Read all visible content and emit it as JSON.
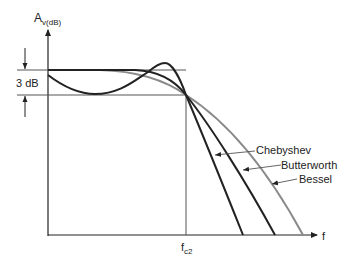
{
  "diagram": {
    "y_axis_label_main": "A",
    "y_axis_label_sub": "v(dB)",
    "x_axis_label": "f",
    "cutoff_label_main": "f",
    "cutoff_label_sub": "c2",
    "ripple_label": "3 dB",
    "curves": [
      {
        "name": "Chebyshev",
        "color": "#222222"
      },
      {
        "name": "Butterworth",
        "color": "#222222"
      },
      {
        "name": "Bessel",
        "color": "#8a8a8a"
      }
    ]
  }
}
